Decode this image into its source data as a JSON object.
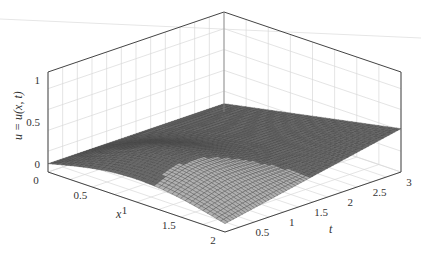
{
  "chart_data": {
    "type": "surface",
    "title": "",
    "xlabel": "x",
    "ylabel": "t",
    "zlabel": "u = u(x, t)",
    "xlim": [
      0,
      2
    ],
    "ylim": [
      0,
      3
    ],
    "zlim": [
      -0.1,
      1.1
    ],
    "grid": true,
    "x_ticks": [
      "0",
      "0.5",
      "1",
      "1.5",
      "2"
    ],
    "x_tick_values": [
      0,
      0.5,
      1,
      1.5,
      2
    ],
    "t_ticks": [
      "0.5",
      "1",
      "1.5",
      "2",
      "2.5",
      "3"
    ],
    "t_tick_values": [
      0.5,
      1,
      1.5,
      2,
      2.5,
      3
    ],
    "z_ticks": [
      "0",
      "0.5",
      "1"
    ],
    "z_tick_values": [
      0,
      0.5,
      1
    ],
    "surface": {
      "description": "u(x,t) approx: plane rising to ~0.42 at (x=2,t=3) plus a bump near x≈1 that decays in t; u=0 along x=0",
      "corner_values": {
        "x0_t0": 0,
        "x0_t3": 0,
        "x2_t3": 0.42
      },
      "peak_bump": {
        "x": 1.0,
        "t": 0.6,
        "u": 0.3
      }
    },
    "colors": {
      "surface": "#555555",
      "surface_light": "#b0b0b0",
      "grid": "#d8d8d8",
      "axis": "#444444"
    }
  }
}
